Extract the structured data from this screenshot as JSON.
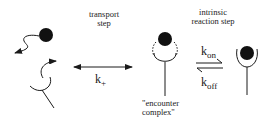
{
  "diagram": {
    "transport_label": [
      "transport",
      "step"
    ],
    "reaction_label": [
      "intrinsic",
      "reaction step"
    ],
    "encounter_label": [
      "\"encounter",
      "complex\""
    ],
    "rate_transport": {
      "base": "k",
      "sub": "+"
    },
    "rate_on": {
      "base": "k",
      "sub": "on"
    },
    "rate_off": {
      "base": "k",
      "sub": "off"
    },
    "colors": {
      "ink": "#1a1a1a",
      "ball": "#111111"
    }
  }
}
